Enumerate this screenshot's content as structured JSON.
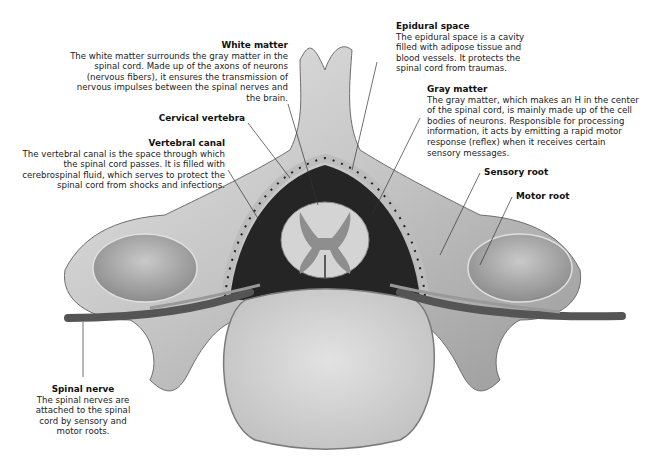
{
  "diagram": {
    "colors": {
      "background": "#ffffff",
      "bone": "#cfcfcf",
      "bone_shadow": "#8a8a8a",
      "canal": "#2a2a2a",
      "white_matter": "#d6d6d6",
      "gray_matter": "#8f8f8f",
      "vertebral_body": "#d9d9d9",
      "nerve": "#5a5a5a",
      "leader_line": "#333333"
    },
    "labels": [
      {
        "id": "white-matter",
        "title": "White matter",
        "description": "The white matter surrounds the gray matter in the spinal cord. Made up of the axons of neurons (nervous fibers), it ensures the transmission of nervous impulses between the spinal nerves and the brain."
      },
      {
        "id": "epidural-space",
        "title": "Epidural space",
        "description": "The epidural space is a cavity filled with adipose tissue and blood vessels. It protects the spinal cord from traumas."
      },
      {
        "id": "gray-matter",
        "title": "Gray matter",
        "description": "The gray matter, which makes an H in the center of the spinal cord, is mainly made up of the cell bodies of neurons. Responsible for processing information, it acts by emitting a rapid motor response (reflex) when it receives certain sensory messages."
      },
      {
        "id": "cervical-vertebra",
        "title": "Cervical vertebra",
        "description": ""
      },
      {
        "id": "vertebral-canal",
        "title": "Vertebral canal",
        "description": "The vertebral canal is the space through which the spinal cord passes. It is filled with cerebrospinal fluid, which serves to protect the spinal cord from shocks and infections."
      },
      {
        "id": "sensory-root",
        "title": "Sensory root",
        "description": ""
      },
      {
        "id": "motor-root",
        "title": "Motor root",
        "description": ""
      },
      {
        "id": "spinal-nerve",
        "title": "Spinal nerve",
        "description": "The spinal nerves are attached to the spinal cord by sensory and motor roots."
      }
    ]
  }
}
